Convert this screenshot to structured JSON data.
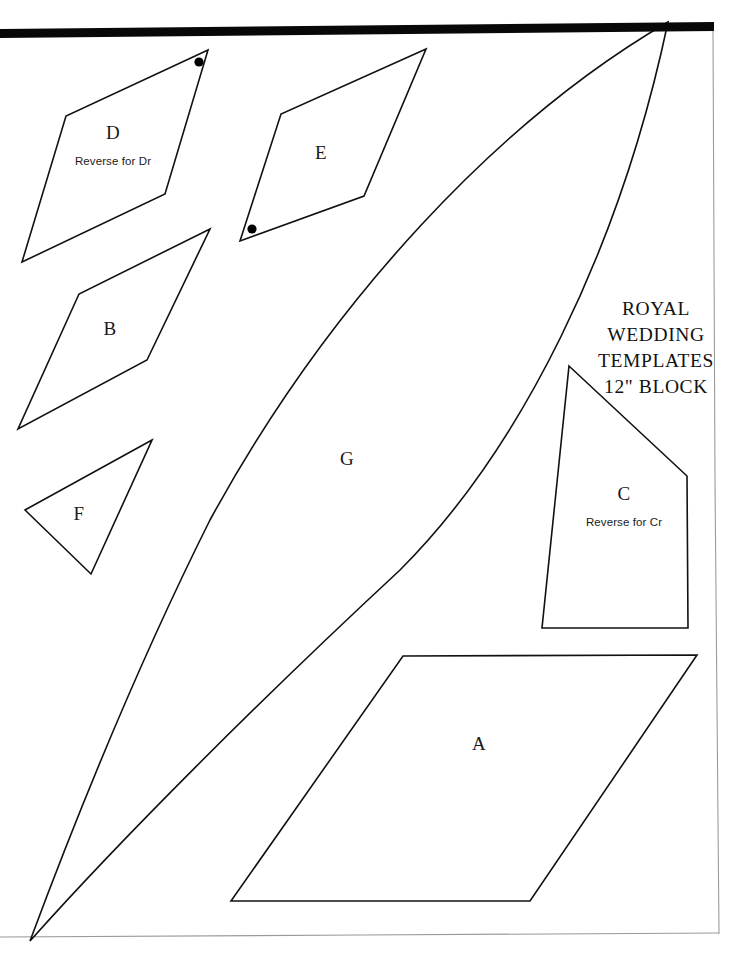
{
  "document": {
    "title_lines": [
      "ROYAL",
      "WEDDING",
      "TEMPLATES",
      "12\" BLOCK"
    ],
    "page_background": "#ffffff",
    "line_color": "#111111",
    "scan_bar_color": "#080808",
    "page_edge_color": "#9a9a9a"
  },
  "pieces": [
    {
      "id": "A",
      "letter": "A",
      "note": "",
      "shape": "parallelogram",
      "label_x": 479,
      "label_y": 744,
      "points": "403,656 697,655 530,901 231,901"
    },
    {
      "id": "B",
      "letter": "B",
      "note": "",
      "shape": "elongated-kite",
      "label_x": 110,
      "label_y": 329,
      "points": "210,229 79,294 18,429 147,360"
    },
    {
      "id": "C",
      "letter": "C",
      "note": "Reverse for Cr",
      "shape": "quadrilateral",
      "label_x": 624,
      "label_y": 506,
      "points": "569,366 687,476 688,628 542,628"
    },
    {
      "id": "D",
      "letter": "D",
      "note": "Reverse for Dr",
      "shape": "elongated-kite",
      "label_x": 113,
      "label_y": 145,
      "points": "208,50 66,116 22,262 165,194"
    },
    {
      "id": "E",
      "letter": "E",
      "note": "",
      "shape": "elongated-kite",
      "label_x": 321,
      "label_y": 153,
      "points": "426,49 281,114 240,241 364,196"
    },
    {
      "id": "F",
      "letter": "F",
      "note": "",
      "shape": "triangle",
      "label_x": 79,
      "label_y": 514,
      "points": "152,440 25,510 91,574"
    },
    {
      "id": "G",
      "letter": "G",
      "note": "",
      "shape": "curved-melon-slice",
      "label_x": 347,
      "label_y": 459,
      "path": "M 668,22 C 500,120 330,300 210,520 C 140,660 75,820 30,941 C 120,840 260,700 400,570 C 520,450 620,250 668,22 Z"
    }
  ],
  "registration_dots": [
    {
      "of_piece": "D",
      "x": 199,
      "y": 62,
      "r": 4.6
    },
    {
      "of_piece": "E",
      "x": 252,
      "y": 229,
      "r": 4.6
    }
  ],
  "page_marks": {
    "scan_bar": {
      "x1": 0,
      "y1": 29,
      "x2": 714,
      "y2": 22,
      "thickness": 9
    },
    "right_edge": {
      "x1": 713,
      "y1": 31,
      "x2": 719,
      "y2": 934
    },
    "bottom_edge": {
      "x1": 0,
      "y1": 937,
      "x2": 719,
      "y2": 933
    }
  }
}
